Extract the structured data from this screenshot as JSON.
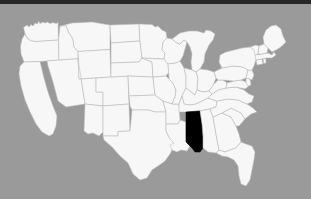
{
  "image": {
    "type": "choropleth-locator-map",
    "subject": "United States of America",
    "description": "Outline map of the contiguous United States with a single state filled solid black",
    "width_px": 311,
    "height_px": 199
  },
  "colors": {
    "background": "#9a9a9a",
    "top_bar": "#262626",
    "state_fill": "#f7f7f7",
    "state_border": "#b9b9b9",
    "highlight_fill": "#000000"
  },
  "map": {
    "title": "",
    "projection_note": "contiguous 48 states",
    "highlighted_state": {
      "name": "Mississippi",
      "abbreviation": "MS",
      "fill": "#000000"
    },
    "legend": [],
    "labels": [],
    "states": [
      {
        "code": "WA",
        "name": "Washington",
        "highlighted": false
      },
      {
        "code": "OR",
        "name": "Oregon",
        "highlighted": false
      },
      {
        "code": "CA",
        "name": "California",
        "highlighted": false
      },
      {
        "code": "NV",
        "name": "Nevada",
        "highlighted": false
      },
      {
        "code": "ID",
        "name": "Idaho",
        "highlighted": false
      },
      {
        "code": "MT",
        "name": "Montana",
        "highlighted": false
      },
      {
        "code": "WY",
        "name": "Wyoming",
        "highlighted": false
      },
      {
        "code": "UT",
        "name": "Utah",
        "highlighted": false
      },
      {
        "code": "AZ",
        "name": "Arizona",
        "highlighted": false
      },
      {
        "code": "NM",
        "name": "New Mexico",
        "highlighted": false
      },
      {
        "code": "CO",
        "name": "Colorado",
        "highlighted": false
      },
      {
        "code": "ND",
        "name": "North Dakota",
        "highlighted": false
      },
      {
        "code": "SD",
        "name": "South Dakota",
        "highlighted": false
      },
      {
        "code": "NE",
        "name": "Nebraska",
        "highlighted": false
      },
      {
        "code": "KS",
        "name": "Kansas",
        "highlighted": false
      },
      {
        "code": "OK",
        "name": "Oklahoma",
        "highlighted": false
      },
      {
        "code": "TX",
        "name": "Texas",
        "highlighted": false
      },
      {
        "code": "MN",
        "name": "Minnesota",
        "highlighted": false
      },
      {
        "code": "IA",
        "name": "Iowa",
        "highlighted": false
      },
      {
        "code": "MO",
        "name": "Missouri",
        "highlighted": false
      },
      {
        "code": "AR",
        "name": "Arkansas",
        "highlighted": false
      },
      {
        "code": "LA",
        "name": "Louisiana",
        "highlighted": false
      },
      {
        "code": "WI",
        "name": "Wisconsin",
        "highlighted": false
      },
      {
        "code": "IL",
        "name": "Illinois",
        "highlighted": false
      },
      {
        "code": "MI",
        "name": "Michigan",
        "highlighted": false
      },
      {
        "code": "IN",
        "name": "Indiana",
        "highlighted": false
      },
      {
        "code": "OH",
        "name": "Ohio",
        "highlighted": false
      },
      {
        "code": "KY",
        "name": "Kentucky",
        "highlighted": false
      },
      {
        "code": "TN",
        "name": "Tennessee",
        "highlighted": false
      },
      {
        "code": "MS",
        "name": "Mississippi",
        "highlighted": true
      },
      {
        "code": "AL",
        "name": "Alabama",
        "highlighted": false
      },
      {
        "code": "GA",
        "name": "Georgia",
        "highlighted": false
      },
      {
        "code": "FL",
        "name": "Florida",
        "highlighted": false
      },
      {
        "code": "SC",
        "name": "South Carolina",
        "highlighted": false
      },
      {
        "code": "NC",
        "name": "North Carolina",
        "highlighted": false
      },
      {
        "code": "VA",
        "name": "Virginia",
        "highlighted": false
      },
      {
        "code": "WV",
        "name": "West Virginia",
        "highlighted": false
      },
      {
        "code": "MD",
        "name": "Maryland",
        "highlighted": false
      },
      {
        "code": "DE",
        "name": "Delaware",
        "highlighted": false
      },
      {
        "code": "PA",
        "name": "Pennsylvania",
        "highlighted": false
      },
      {
        "code": "NJ",
        "name": "New Jersey",
        "highlighted": false
      },
      {
        "code": "NY",
        "name": "New York",
        "highlighted": false
      },
      {
        "code": "CT",
        "name": "Connecticut",
        "highlighted": false
      },
      {
        "code": "RI",
        "name": "Rhode Island",
        "highlighted": false
      },
      {
        "code": "MA",
        "name": "Massachusetts",
        "highlighted": false
      },
      {
        "code": "VT",
        "name": "Vermont",
        "highlighted": false
      },
      {
        "code": "NH",
        "name": "New Hampshire",
        "highlighted": false
      },
      {
        "code": "ME",
        "name": "Maine",
        "highlighted": false
      }
    ]
  }
}
